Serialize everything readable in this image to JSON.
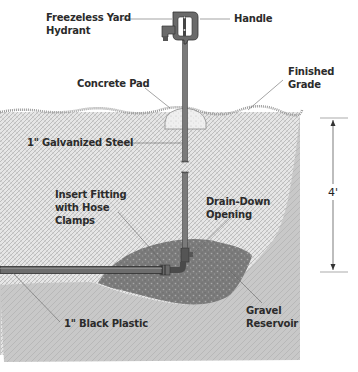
{
  "diagram": {
    "labels": {
      "hydrant_line1": "Freezeless Yard",
      "hydrant_line2": "Hydrant",
      "handle": "Handle",
      "concrete_pad": "Concrete Pad",
      "finished_grade_line1": "Finished",
      "finished_grade_line2": "Grade",
      "galvanized_steel": "1\" Galvanized Steel",
      "insert_fitting_line1": "Insert Fitting",
      "insert_fitting_line2": "with Hose",
      "insert_fitting_line3": "Clamps",
      "drain_down_line1": "Drain-Down",
      "drain_down_line2": "Opening",
      "black_plastic": "1\" Black Plastic",
      "gravel_line1": "Gravel",
      "gravel_line2": "Reservoir"
    },
    "dimension": {
      "depth": "4'"
    },
    "colors": {
      "soil_light": "#e4e4e4",
      "soil_dark": "#c6c6c6",
      "gravel": "#7a7a7a",
      "pipe": "#5a5a5a",
      "text": "#2b2b2b",
      "leader": "#555555"
    }
  }
}
